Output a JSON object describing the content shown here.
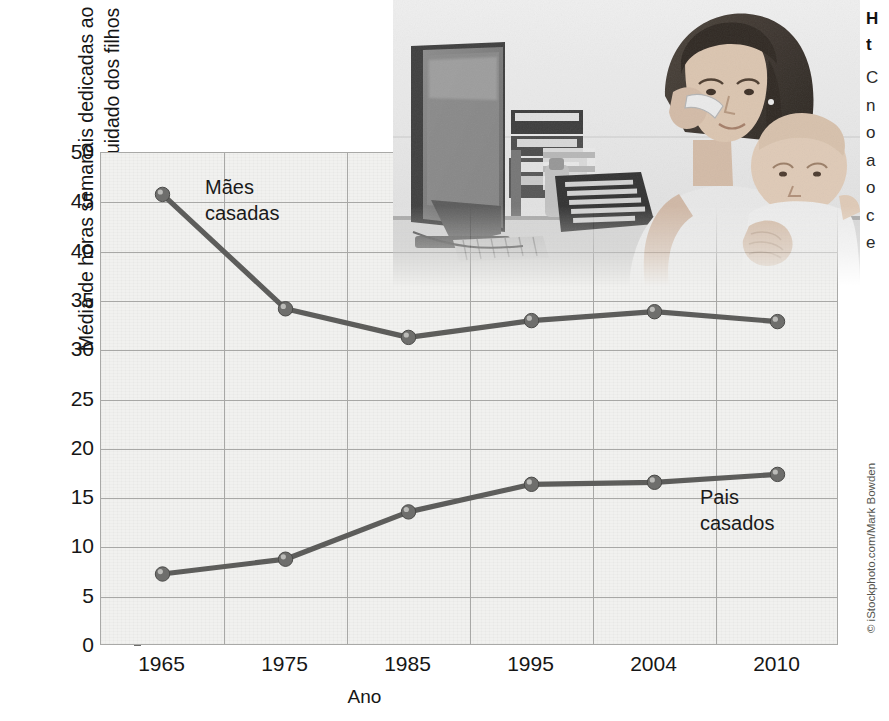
{
  "chart_data": {
    "type": "line",
    "title": "",
    "xlabel": "Ano",
    "ylabel": "Média de horas semanais dedicadas ao\ntrabalho doméstico e cuidado dos filhos",
    "categories": [
      "1965",
      "1975",
      "1985",
      "1995",
      "2004",
      "2010"
    ],
    "ylim": [
      0,
      50
    ],
    "yticks": [
      "0",
      "5",
      "10",
      "15",
      "20",
      "25",
      "30",
      "35",
      "40",
      "45",
      "50"
    ],
    "grid": true,
    "legend_position": "inline-annotations",
    "series": [
      {
        "name": "Mães casadas",
        "label": "Mães\ncasadas",
        "values": [
          45.8,
          34.2,
          31.3,
          33.0,
          33.9,
          32.9
        ],
        "color": "#5d5d5b"
      },
      {
        "name": "Pais casados",
        "label": "Pais\ncasados",
        "values": [
          7.3,
          8.8,
          13.6,
          16.4,
          16.6,
          17.4
        ],
        "color": "#5d5d5b"
      }
    ]
  },
  "photo": {
    "alt_name": "mother-on-phone-holding-baby-at-desk",
    "credit": "© iStockphoto.com/Mark Bowden"
  },
  "right_column": {
    "heading": "H\nt",
    "body": "C\nn\no\na\no\nc\ne"
  },
  "colors": {
    "plot_background": "#f1f1ef",
    "gridline": "#a8a8a6",
    "series": "#5d5d5b",
    "text": "#161616"
  }
}
